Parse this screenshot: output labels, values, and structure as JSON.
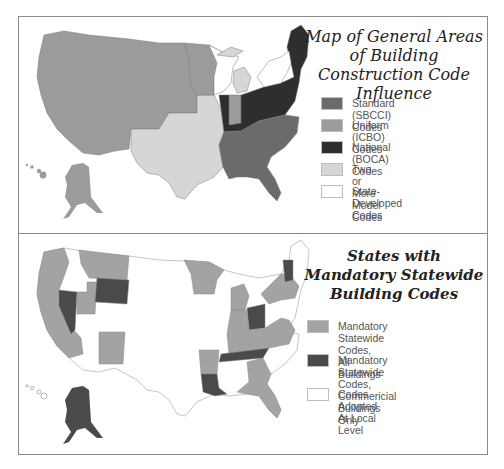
{
  "colors": {
    "standard_sbcci": "#6b6b6b",
    "uniform_icbo": "#9b9b9b",
    "national_boca": "#2e2e2e",
    "two_or_more": "#d6d6d6",
    "state_developed": "#ffffff",
    "mandatory_all": "#a3a3a3",
    "mandatory_commercial": "#4a4a4a",
    "local_level": "#ffffff",
    "border": "#8a8a8a"
  },
  "top_map": {
    "title": "Map of General Areas of Building Construction Code Influence",
    "legend": [
      {
        "label": "Standard (SBCCI) Codes",
        "color": "#6b6b6b"
      },
      {
        "label": "Uniform (ICBO) Codes",
        "color": "#9b9b9b"
      },
      {
        "label": "National (BOCA) Codes",
        "color": "#2e2e2e"
      },
      {
        "label": "Two or More Model Codes",
        "color": "#d6d6d6"
      },
      {
        "label": "State-Developed Codes",
        "color": "#ffffff"
      }
    ]
  },
  "bottom_map": {
    "title": "States with Mandatory Statewide Building Codes",
    "legend": [
      {
        "label": "Mandatory Statewide Codes,\nAll Buildings",
        "color": "#a3a3a3"
      },
      {
        "label": "Mandatory Statewide Codes,\nCommericial Buildings Only",
        "color": "#4a4a4a"
      },
      {
        "label": "Codes Adopted At Local Level",
        "color": "#ffffff"
      }
    ]
  }
}
